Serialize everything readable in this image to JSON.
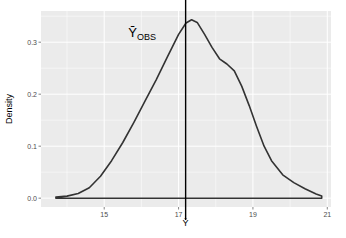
{
  "chart_data": {
    "type": "line",
    "title": "",
    "xlabel": "Ȳ",
    "ylabel": "Density",
    "xlim": [
      13.3,
      21.1
    ],
    "ylim": [
      -0.017,
      0.36
    ],
    "x_ticks": [
      15,
      17,
      19,
      21
    ],
    "x_tick_labels": [
      "15",
      "17",
      "19",
      "21"
    ],
    "y_ticks": [
      0.0,
      0.1,
      0.2,
      0.3
    ],
    "y_tick_labels": [
      "0.0",
      "0.1",
      "0.2",
      "0.3"
    ],
    "grid": true,
    "legend": null,
    "series": [
      {
        "name": "density",
        "color": "#333333",
        "x": [
          13.7,
          14.0,
          14.3,
          14.6,
          14.9,
          15.2,
          15.5,
          15.8,
          16.1,
          16.4,
          16.7,
          17.0,
          17.2,
          17.35,
          17.5,
          17.7,
          17.9,
          18.1,
          18.3,
          18.5,
          18.7,
          18.9,
          19.1,
          19.3,
          19.5,
          19.8,
          20.1,
          20.4,
          20.7,
          20.85
        ],
        "values": [
          0.002,
          0.004,
          0.009,
          0.02,
          0.042,
          0.072,
          0.107,
          0.146,
          0.187,
          0.228,
          0.272,
          0.315,
          0.337,
          0.343,
          0.338,
          0.315,
          0.29,
          0.268,
          0.258,
          0.245,
          0.215,
          0.178,
          0.138,
          0.1,
          0.072,
          0.045,
          0.03,
          0.018,
          0.008,
          0.004
        ]
      }
    ],
    "annotations": [
      {
        "type": "vline",
        "x": 17.19,
        "color": "#000000",
        "label": "Ȳ",
        "label_subscript": "OBS",
        "label_x": 15.65,
        "label_y": 0.31
      }
    ],
    "panel_background": "#ebebeb",
    "grid_color": "#ffffff"
  }
}
